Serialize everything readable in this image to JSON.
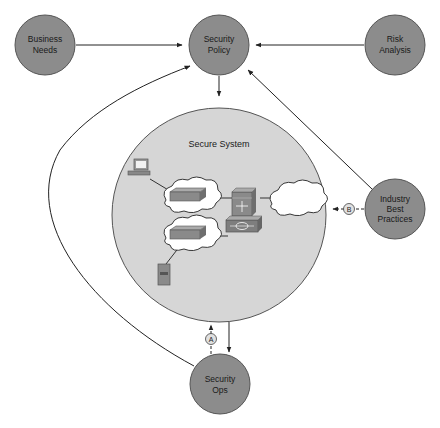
{
  "diagram": {
    "nodes": {
      "business_needs": {
        "lines": [
          "Business",
          "Needs"
        ]
      },
      "security_policy": {
        "lines": [
          "Security",
          "Policy"
        ]
      },
      "risk_analysis": {
        "lines": [
          "Risk",
          "Analysis"
        ]
      },
      "secure_system": {
        "title": "Secure System"
      },
      "industry_best_practices": {
        "lines": [
          "Industry",
          "Best",
          "Practices"
        ]
      },
      "security_ops": {
        "lines": [
          "Security",
          "Ops"
        ]
      }
    },
    "markers": {
      "a": "A",
      "b": "B"
    },
    "edges": [
      {
        "from": "Business Needs",
        "to": "Security Policy",
        "style": "solid"
      },
      {
        "from": "Risk Analysis",
        "to": "Security Policy",
        "style": "solid"
      },
      {
        "from": "Security Policy",
        "to": "Secure System",
        "style": "solid"
      },
      {
        "from": "Industry Best Practices",
        "to": "Security Policy",
        "style": "solid"
      },
      {
        "from": "Security Ops",
        "to": "Security Policy",
        "style": "solid-curve"
      },
      {
        "from": "Secure System",
        "to": "Security Ops",
        "style": "solid"
      },
      {
        "from": "Security Ops",
        "to": "Secure System",
        "style": "dashed",
        "marker": "A"
      },
      {
        "from": "Industry Best Practices",
        "to": "Secure System",
        "style": "dashed",
        "marker": "B"
      }
    ],
    "colors": {
      "node_fill": "#8c8c8c",
      "node_stroke": "#555555",
      "system_fill": "#d6d6d6",
      "line": "#222222",
      "cloud_fill": "#ffffff"
    }
  }
}
